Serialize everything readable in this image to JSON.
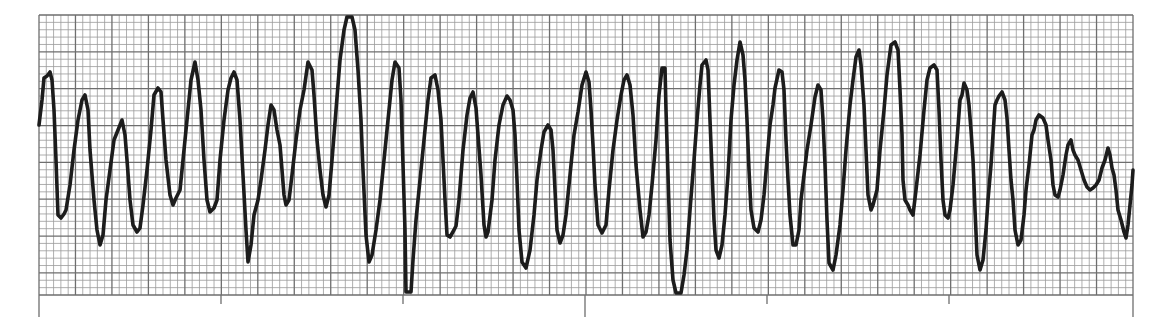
{
  "colors": {
    "background": "#ffffff",
    "grid_minor": "#9a9a9a",
    "grid_major": "#6e6e6e",
    "trace": "#1c1c1c"
  },
  "grid": {
    "left": 39,
    "top": 15,
    "right": 1133,
    "bottom": 295,
    "minor_px": 7.3,
    "major_px": 36.5
  },
  "time_marks": [
    {
      "x": 39,
      "length": "long"
    },
    {
      "x": 221,
      "length": "short"
    },
    {
      "x": 403,
      "length": "short"
    },
    {
      "x": 585,
      "length": "long"
    },
    {
      "x": 767,
      "length": "short"
    },
    {
      "x": 949,
      "length": "short"
    },
    {
      "x": 1133,
      "length": "long"
    }
  ],
  "trace_points": [
    [
      39,
      125
    ],
    [
      42,
      100
    ],
    [
      44,
      78
    ],
    [
      47,
      76
    ],
    [
      50,
      72
    ],
    [
      52,
      80
    ],
    [
      54,
      110
    ],
    [
      56,
      160
    ],
    [
      58,
      215
    ],
    [
      61,
      218
    ],
    [
      64,
      214
    ],
    [
      66,
      210
    ],
    [
      70,
      185
    ],
    [
      74,
      150
    ],
    [
      78,
      120
    ],
    [
      82,
      100
    ],
    [
      85,
      95
    ],
    [
      88,
      110
    ],
    [
      90,
      150
    ],
    [
      94,
      200
    ],
    [
      97,
      230
    ],
    [
      100,
      245
    ],
    [
      103,
      235
    ],
    [
      106,
      200
    ],
    [
      110,
      170
    ],
    [
      114,
      140
    ],
    [
      118,
      130
    ],
    [
      122,
      120
    ],
    [
      125,
      135
    ],
    [
      127,
      160
    ],
    [
      130,
      200
    ],
    [
      133,
      225
    ],
    [
      137,
      232
    ],
    [
      140,
      228
    ],
    [
      143,
      205
    ],
    [
      147,
      170
    ],
    [
      151,
      130
    ],
    [
      154,
      95
    ],
    [
      158,
      88
    ],
    [
      161,
      92
    ],
    [
      163,
      120
    ],
    [
      166,
      160
    ],
    [
      170,
      195
    ],
    [
      173,
      205
    ],
    [
      176,
      198
    ],
    [
      180,
      190
    ],
    [
      183,
      160
    ],
    [
      187,
      120
    ],
    [
      191,
      80
    ],
    [
      195,
      62
    ],
    [
      198,
      80
    ],
    [
      201,
      110
    ],
    [
      204,
      160
    ],
    [
      207,
      200
    ],
    [
      210,
      212
    ],
    [
      214,
      208
    ],
    [
      217,
      200
    ],
    [
      220,
      160
    ],
    [
      224,
      120
    ],
    [
      228,
      90
    ],
    [
      231,
      78
    ],
    [
      234,
      72
    ],
    [
      237,
      80
    ],
    [
      240,
      120
    ],
    [
      243,
      175
    ],
    [
      246,
      230
    ],
    [
      248,
      262
    ],
    [
      251,
      245
    ],
    [
      254,
      215
    ],
    [
      258,
      200
    ],
    [
      261,
      180
    ],
    [
      265,
      150
    ],
    [
      268,
      125
    ],
    [
      271,
      105
    ],
    [
      274,
      110
    ],
    [
      277,
      130
    ],
    [
      280,
      145
    ],
    [
      282,
      170
    ],
    [
      284,
      195
    ],
    [
      286,
      205
    ],
    [
      289,
      200
    ],
    [
      292,
      175
    ],
    [
      296,
      140
    ],
    [
      300,
      110
    ],
    [
      304,
      90
    ],
    [
      308,
      62
    ],
    [
      312,
      70
    ],
    [
      314,
      95
    ],
    [
      317,
      140
    ],
    [
      320,
      170
    ],
    [
      323,
      195
    ],
    [
      326,
      207
    ],
    [
      329,
      195
    ],
    [
      332,
      160
    ],
    [
      336,
      110
    ],
    [
      340,
      60
    ],
    [
      344,
      30
    ],
    [
      347,
      17
    ],
    [
      352,
      17
    ],
    [
      355,
      30
    ],
    [
      358,
      70
    ],
    [
      361,
      120
    ],
    [
      363,
      170
    ],
    [
      366,
      235
    ],
    [
      369,
      262
    ],
    [
      372,
      255
    ],
    [
      376,
      230
    ],
    [
      380,
      200
    ],
    [
      384,
      160
    ],
    [
      388,
      120
    ],
    [
      392,
      80
    ],
    [
      395,
      62
    ],
    [
      399,
      68
    ],
    [
      401,
      100
    ],
    [
      403,
      165
    ],
    [
      405,
      230
    ],
    [
      406,
      292
    ],
    [
      411,
      292
    ],
    [
      413,
      260
    ],
    [
      416,
      220
    ],
    [
      420,
      180
    ],
    [
      424,
      140
    ],
    [
      428,
      100
    ],
    [
      431,
      78
    ],
    [
      435,
      75
    ],
    [
      438,
      90
    ],
    [
      441,
      120
    ],
    [
      443,
      160
    ],
    [
      445,
      200
    ],
    [
      447,
      235
    ],
    [
      450,
      237
    ],
    [
      454,
      230
    ],
    [
      456,
      226
    ],
    [
      459,
      200
    ],
    [
      463,
      150
    ],
    [
      467,
      115
    ],
    [
      470,
      98
    ],
    [
      473,
      92
    ],
    [
      476,
      108
    ],
    [
      478,
      135
    ],
    [
      481,
      175
    ],
    [
      484,
      225
    ],
    [
      486,
      237
    ],
    [
      488,
      232
    ],
    [
      492,
      200
    ],
    [
      495,
      160
    ],
    [
      499,
      125
    ],
    [
      503,
      105
    ],
    [
      507,
      96
    ],
    [
      510,
      100
    ],
    [
      513,
      110
    ],
    [
      515,
      135
    ],
    [
      517,
      180
    ],
    [
      519,
      230
    ],
    [
      522,
      262
    ],
    [
      526,
      268
    ],
    [
      530,
      250
    ],
    [
      534,
      215
    ],
    [
      537,
      180
    ],
    [
      541,
      150
    ],
    [
      544,
      132
    ],
    [
      548,
      125
    ],
    [
      551,
      130
    ],
    [
      553,
      150
    ],
    [
      555,
      190
    ],
    [
      557,
      230
    ],
    [
      560,
      243
    ],
    [
      563,
      235
    ],
    [
      566,
      215
    ],
    [
      570,
      175
    ],
    [
      574,
      135
    ],
    [
      578,
      112
    ],
    [
      582,
      85
    ],
    [
      586,
      72
    ],
    [
      589,
      82
    ],
    [
      591,
      110
    ],
    [
      593,
      145
    ],
    [
      595,
      185
    ],
    [
      598,
      225
    ],
    [
      602,
      233
    ],
    [
      606,
      225
    ],
    [
      609,
      190
    ],
    [
      613,
      150
    ],
    [
      617,
      120
    ],
    [
      621,
      95
    ],
    [
      624,
      80
    ],
    [
      627,
      75
    ],
    [
      630,
      85
    ],
    [
      633,
      115
    ],
    [
      636,
      165
    ],
    [
      640,
      210
    ],
    [
      643,
      237
    ],
    [
      646,
      232
    ],
    [
      649,
      215
    ],
    [
      652,
      185
    ],
    [
      656,
      140
    ],
    [
      659,
      95
    ],
    [
      662,
      68
    ],
    [
      665,
      68
    ],
    [
      666,
      110
    ],
    [
      668,
      175
    ],
    [
      670,
      240
    ],
    [
      673,
      280
    ],
    [
      676,
      293
    ],
    [
      681,
      293
    ],
    [
      684,
      275
    ],
    [
      687,
      250
    ],
    [
      690,
      210
    ],
    [
      694,
      160
    ],
    [
      697,
      120
    ],
    [
      700,
      85
    ],
    [
      702,
      65
    ],
    [
      706,
      60
    ],
    [
      708,
      70
    ],
    [
      710,
      120
    ],
    [
      712,
      170
    ],
    [
      714,
      220
    ],
    [
      716,
      250
    ],
    [
      719,
      258
    ],
    [
      722,
      245
    ],
    [
      725,
      215
    ],
    [
      728,
      175
    ],
    [
      731,
      120
    ],
    [
      734,
      85
    ],
    [
      737,
      60
    ],
    [
      740,
      42
    ],
    [
      743,
      55
    ],
    [
      745,
      80
    ],
    [
      747,
      120
    ],
    [
      749,
      170
    ],
    [
      751,
      210
    ],
    [
      754,
      228
    ],
    [
      758,
      232
    ],
    [
      761,
      220
    ],
    [
      764,
      195
    ],
    [
      767,
      160
    ],
    [
      770,
      125
    ],
    [
      773,
      105
    ],
    [
      775,
      88
    ],
    [
      779,
      70
    ],
    [
      782,
      72
    ],
    [
      784,
      90
    ],
    [
      786,
      140
    ],
    [
      788,
      180
    ],
    [
      790,
      215
    ],
    [
      793,
      245
    ],
    [
      796,
      245
    ],
    [
      799,
      230
    ],
    [
      801,
      200
    ],
    [
      804,
      175
    ],
    [
      807,
      150
    ],
    [
      811,
      125
    ],
    [
      815,
      97
    ],
    [
      818,
      85
    ],
    [
      821,
      90
    ],
    [
      823,
      120
    ],
    [
      825,
      165
    ],
    [
      827,
      220
    ],
    [
      829,
      263
    ],
    [
      833,
      270
    ],
    [
      836,
      255
    ],
    [
      840,
      225
    ],
    [
      843,
      190
    ],
    [
      846,
      150
    ],
    [
      850,
      105
    ],
    [
      853,
      80
    ],
    [
      856,
      57
    ],
    [
      859,
      50
    ],
    [
      861,
      65
    ],
    [
      864,
      105
    ],
    [
      866,
      150
    ],
    [
      868,
      195
    ],
    [
      871,
      210
    ],
    [
      873,
      205
    ],
    [
      877,
      190
    ],
    [
      880,
      150
    ],
    [
      884,
      110
    ],
    [
      887,
      75
    ],
    [
      891,
      45
    ],
    [
      895,
      42
    ],
    [
      898,
      50
    ],
    [
      900,
      90
    ],
    [
      902,
      135
    ],
    [
      903,
      180
    ],
    [
      905,
      200
    ],
    [
      908,
      205
    ],
    [
      910,
      210
    ],
    [
      913,
      215
    ],
    [
      916,
      190
    ],
    [
      920,
      155
    ],
    [
      924,
      110
    ],
    [
      927,
      80
    ],
    [
      930,
      68
    ],
    [
      934,
      65
    ],
    [
      937,
      70
    ],
    [
      939,
      110
    ],
    [
      941,
      160
    ],
    [
      943,
      200
    ],
    [
      945,
      215
    ],
    [
      948,
      218
    ],
    [
      950,
      210
    ],
    [
      953,
      185
    ],
    [
      957,
      140
    ],
    [
      960,
      100
    ],
    [
      962,
      95
    ],
    [
      964,
      83
    ],
    [
      967,
      90
    ],
    [
      969,
      105
    ],
    [
      971,
      130
    ],
    [
      973,
      160
    ],
    [
      975,
      210
    ],
    [
      977,
      255
    ],
    [
      980,
      270
    ],
    [
      983,
      260
    ],
    [
      986,
      230
    ],
    [
      988,
      200
    ],
    [
      991,
      165
    ],
    [
      993,
      135
    ],
    [
      995,
      105
    ],
    [
      997,
      100
    ],
    [
      999,
      96
    ],
    [
      1002,
      92
    ],
    [
      1005,
      100
    ],
    [
      1007,
      118
    ],
    [
      1009,
      150
    ],
    [
      1011,
      180
    ],
    [
      1013,
      200
    ],
    [
      1015,
      230
    ],
    [
      1018,
      245
    ],
    [
      1021,
      240
    ],
    [
      1024,
      215
    ],
    [
      1026,
      190
    ],
    [
      1029,
      165
    ],
    [
      1032,
      135
    ],
    [
      1034,
      130
    ],
    [
      1036,
      120
    ],
    [
      1039,
      115
    ],
    [
      1043,
      118
    ],
    [
      1046,
      125
    ],
    [
      1048,
      140
    ],
    [
      1051,
      160
    ],
    [
      1053,
      185
    ],
    [
      1055,
      195
    ],
    [
      1058,
      197
    ],
    [
      1060,
      190
    ],
    [
      1063,
      175
    ],
    [
      1066,
      155
    ],
    [
      1068,
      145
    ],
    [
      1071,
      140
    ],
    [
      1073,
      150
    ],
    [
      1075,
      155
    ],
    [
      1078,
      160
    ],
    [
      1081,
      170
    ],
    [
      1084,
      180
    ],
    [
      1087,
      187
    ],
    [
      1090,
      190
    ],
    [
      1093,
      188
    ],
    [
      1096,
      185
    ],
    [
      1099,
      180
    ],
    [
      1102,
      168
    ],
    [
      1105,
      160
    ],
    [
      1108,
      148
    ],
    [
      1110,
      155
    ],
    [
      1112,
      168
    ],
    [
      1114,
      175
    ],
    [
      1116,
      190
    ],
    [
      1118,
      210
    ],
    [
      1121,
      220
    ],
    [
      1124,
      232
    ],
    [
      1126,
      238
    ],
    [
      1128,
      225
    ],
    [
      1130,
      205
    ],
    [
      1132,
      185
    ],
    [
      1133,
      170
    ]
  ],
  "aria": {
    "strip_label": "Rhythm strip on graph paper"
  }
}
